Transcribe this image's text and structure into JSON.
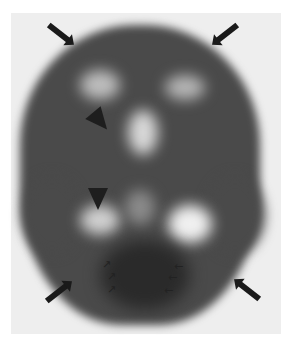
{
  "image": {
    "subject": "axial brain perfusion scan (grayscale)",
    "background_color": "#eeeeee",
    "markers": {
      "large_arrows": [
        {
          "position": "top-left",
          "direction": "down-right"
        },
        {
          "position": "top-right",
          "direction": "down-left"
        },
        {
          "position": "bottom-left",
          "direction": "up-right"
        },
        {
          "position": "bottom-right",
          "direction": "up-left"
        }
      ],
      "arrowheads": [
        {
          "position": "upper-left-center"
        },
        {
          "position": "mid-left-center"
        }
      ],
      "small_arrows": {
        "left_group_count": 3,
        "right_group_count": 3,
        "left_glyph": "↗",
        "right_glyph": "←"
      }
    }
  }
}
